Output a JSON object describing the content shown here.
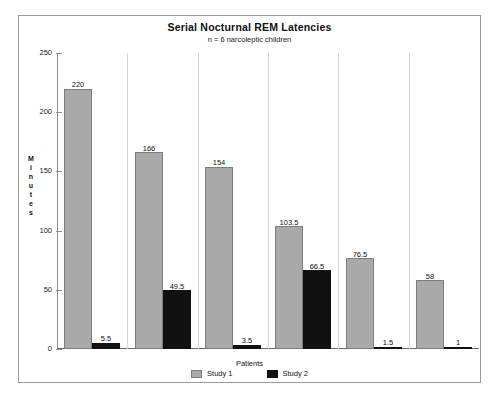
{
  "chart_data": {
    "type": "bar",
    "title": "Serial Nocturnal REM Latencies",
    "subtitle": "n = 6 narcoleptic children",
    "xlabel": "Patients",
    "ylabel": "Minutes",
    "ylim": [
      0,
      250
    ],
    "yticks": [
      0,
      50,
      100,
      150,
      200,
      250
    ],
    "ytick_labels": [
      "0",
      "50",
      "100",
      "150",
      "200",
      "250"
    ],
    "grid": false,
    "legend_position": "bottom",
    "categories": [
      "1",
      "2",
      "3",
      "4",
      "5",
      "6"
    ],
    "series": [
      {
        "name": "Study 1",
        "color": "#a9a9a9",
        "values": [
          220,
          166,
          154,
          103.5,
          76.5,
          58
        ],
        "labels": [
          "220",
          "166",
          "154",
          "103.5",
          "76.5",
          "58"
        ]
      },
      {
        "name": "Study 2",
        "color": "#111111",
        "values": [
          5.5,
          49.5,
          3.5,
          66.5,
          1.5,
          1
        ],
        "labels": [
          "5.5",
          "49.5",
          "3.5",
          "66.5",
          "1.5",
          "1"
        ]
      }
    ]
  },
  "legend": {
    "items": [
      {
        "label": "Study 1",
        "swatch": "legend-swatch-study-1"
      },
      {
        "label": "Study 2",
        "swatch": "legend-swatch-study-2"
      }
    ]
  }
}
